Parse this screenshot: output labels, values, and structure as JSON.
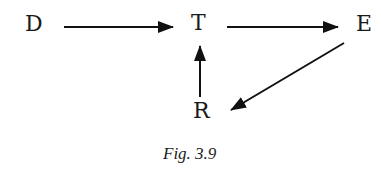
{
  "diagram": {
    "nodes": [
      {
        "id": "D",
        "label": "D"
      },
      {
        "id": "T",
        "label": "T"
      },
      {
        "id": "E",
        "label": "E"
      },
      {
        "id": "R",
        "label": "R"
      }
    ],
    "edges": [
      {
        "from": "D",
        "to": "T"
      },
      {
        "from": "T",
        "to": "E"
      },
      {
        "from": "E",
        "to": "R"
      },
      {
        "from": "R",
        "to": "T"
      }
    ],
    "caption": "Fig. 3.9"
  }
}
